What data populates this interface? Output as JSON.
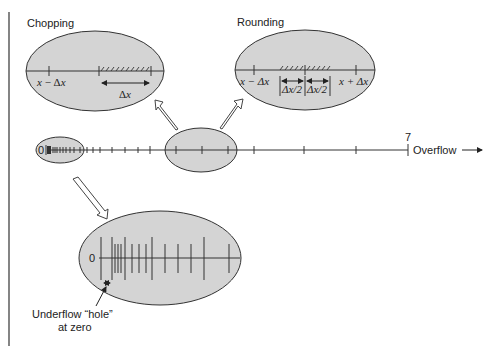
{
  "titles": {
    "chopping": "Chopping",
    "rounding": "Rounding"
  },
  "chopping_inset": {
    "left_label_x": "x",
    "left_label_op": " − Δ",
    "left_label_x2": "x",
    "interval_label": "Δ",
    "interval_label_x": "x"
  },
  "rounding_inset": {
    "left_label": "x − Δx",
    "half_left": "Δx/2",
    "half_right": "Δx/2",
    "right_label": "x + Δx"
  },
  "number_line": {
    "zero_label": "0",
    "max_label": "7",
    "overflow_label": "Overflow"
  },
  "underflow_inset": {
    "zero_label": "0",
    "annotation_line1": "Underflow “hole”",
    "annotation_line2": "at zero"
  },
  "colors": {
    "ellipse_fill": "#d4d4d4",
    "stroke": "#333333",
    "background": "#ffffff"
  }
}
